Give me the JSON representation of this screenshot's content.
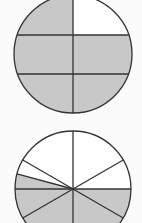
{
  "colors": {
    "background": "#fbfbfb",
    "shaded": "#c8c8c8",
    "unshaded": "#ffffff",
    "stroke": "#333333"
  },
  "figures": [
    {
      "id": "circle-horizontal-partition",
      "description": "Circle divided by one vertical line and two horizontal lines into 6 regions; all regions shaded except the top-right",
      "center": [
        73,
        54
      ],
      "radius": 59,
      "vertical_line_x": 73,
      "horizontal_lines_y": [
        35,
        74
      ],
      "unshaded_region": "top-right"
    },
    {
      "id": "circle-radial-partition",
      "description": "Circle divided by radial lines from the center into sectors; lower half plus a thin left sector shaded",
      "center": [
        73,
        189
      ],
      "radius": 58,
      "radial_angles_deg": [
        0,
        30,
        90,
        150,
        165,
        180,
        210,
        270,
        330
      ],
      "shaded_range_deg": [
        165,
        360
      ]
    }
  ]
}
